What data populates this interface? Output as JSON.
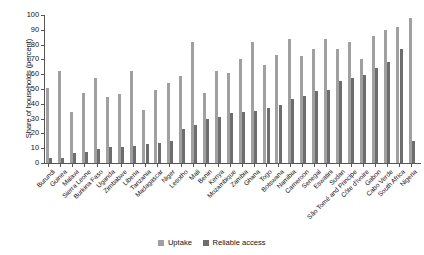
{
  "chart_data": {
    "type": "bar",
    "title": "",
    "xlabel": "",
    "ylabel": "Share of households (percent)",
    "ylim": [
      0,
      100
    ],
    "yticks": [
      0,
      10,
      20,
      30,
      40,
      50,
      60,
      70,
      80,
      90,
      100
    ],
    "grid": false,
    "legend_position": "bottom-center",
    "categories": [
      "Burundi",
      "Guinea",
      "Malawi",
      "Sierra Leone",
      "Burkina Faso",
      "Uganda",
      "Zimbabwe",
      "Liberia",
      "Tanzania",
      "Madagascar",
      "Niger",
      "Lesotho",
      "Mali",
      "Benin",
      "Kenya",
      "Mozambique",
      "Zambia",
      "Ghana",
      "Togo",
      "Botswana",
      "Namibia",
      "Cameroon",
      "Senegal",
      "Eswatini",
      "Sudan",
      "São Tomé and Principe",
      "Côte d'Ivoire",
      "Gabon",
      "Cabo Verde",
      "South Africa",
      "Nigeria"
    ],
    "series": [
      {
        "name": "Uptake",
        "color": "#a0a0a0",
        "values": [
          50.5,
          62.0,
          34.5,
          47.5,
          57.5,
          44.5,
          46.5,
          62.5,
          36.0,
          49.0,
          54.0,
          59.0,
          81.5,
          47.5,
          62.5,
          61.0,
          70.0,
          81.5,
          66.5,
          73.0,
          84.0,
          72.0,
          77.0,
          84.0,
          77.0,
          82.0,
          70.0,
          86.0,
          90.0,
          92.0,
          98.0
        ]
      },
      {
        "name": "Reliable access",
        "color": "#6d6d6d",
        "values": [
          3.5,
          3.5,
          6.5,
          7.5,
          9.5,
          10.5,
          10.5,
          11.5,
          13.0,
          13.5,
          15.0,
          23.0,
          25.5,
          29.5,
          31.0,
          33.5,
          34.5,
          35.0,
          37.5,
          39.5,
          43.5,
          45.5,
          48.5,
          49.5,
          55.5,
          57.5,
          59.5,
          64.0,
          68.5,
          77.0,
          15.0
        ]
      }
    ]
  },
  "legend": {
    "items": [
      {
        "label": "Uptake",
        "color": "#a0a0a0"
      },
      {
        "label": "Reliable access",
        "color": "#6d6d6d"
      }
    ]
  }
}
